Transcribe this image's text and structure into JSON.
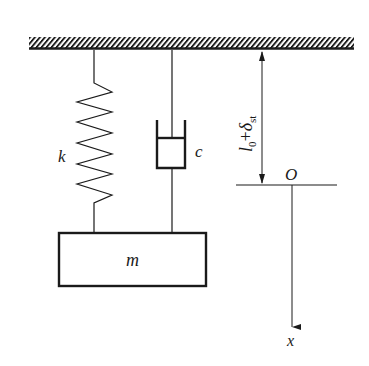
{
  "diagram": {
    "labels": {
      "spring": "k",
      "damper": "c",
      "mass": "m",
      "origin": "O",
      "axis": "x",
      "dimension_l": "l",
      "dimension_l_sub": "0",
      "dimension_plus": "+",
      "dimension_delta": "δ",
      "dimension_delta_sub": "st"
    },
    "colors": {
      "stroke": "#1a1a1a",
      "background": "#ffffff"
    }
  }
}
